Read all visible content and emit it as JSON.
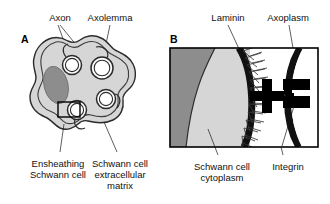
{
  "figure": {
    "type": "scientific-diagram",
    "background_color": "#ffffff",
    "width": 330,
    "height": 204
  },
  "panels": [
    {
      "id": "A",
      "letter": "A",
      "caption": "Transverse section of an ensheathing (non-myelinating) Schwann cell enclosing several axons",
      "labels_top": [
        {
          "key": "axon",
          "text": "Axon"
        },
        {
          "key": "axolemma",
          "text": "Axolemma"
        }
      ],
      "labels_bottom": [
        {
          "key": "ensheathing_schwann_cell",
          "line1": "Ensheathing",
          "line2": "Schwann cell"
        },
        {
          "key": "schwann_cell_ecm",
          "line1": "Schwann cell",
          "line2": "extracellular",
          "line3": "matrix"
        }
      ]
    },
    {
      "id": "B",
      "letter": "B",
      "caption": "Enlargement of the boxed region showing laminin fibrils and integrin linking Schwann cell to axon",
      "labels_top": [
        {
          "key": "laminin",
          "text": "Laminin"
        },
        {
          "key": "axoplasm",
          "text": "Axoplasm"
        }
      ],
      "labels_bottom": [
        {
          "key": "schwann_cell_cytoplasm",
          "line1": "Schwann cell",
          "line2": "cytoplasm"
        },
        {
          "key": "integrin",
          "line1": "Integrin"
        }
      ]
    }
  ],
  "colors": {
    "outline": "#2b2b2b",
    "cytoplasm": "#d6d6d6",
    "nucleus": "#8d8d8d",
    "axon_lumen": "#ffffff",
    "membrane_dark": "#111111",
    "laminin_fibril": "#3a3a3a",
    "integrin_block": "#000000",
    "panel_frame": "#000000",
    "text": "#111111"
  }
}
